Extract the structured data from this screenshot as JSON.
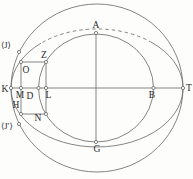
{
  "figure": {
    "style": {
      "background": "#fdfdfc",
      "stroke_color": "#666666",
      "text_color": "#2a2a2a",
      "stroke_width": 0.8,
      "marker_radius": 1.6,
      "marker_fill": "#fdfdfc",
      "font_size": 9.5,
      "small_font_size": 8.5,
      "dash_pattern": "3.5 3"
    },
    "curves": {
      "outer_circle": {
        "cx": 97,
        "cy": 88,
        "rx": 86,
        "ry": 84
      },
      "inner_ellipse": {
        "cx": 96,
        "cy": 88,
        "rx": 57.5,
        "ry": 54
      },
      "middle_ellipse": {
        "cx": 97,
        "cy": 88,
        "rx": 86,
        "ry": 59,
        "solid_arc": "M 41 43.2 A 86 59 0 1 0 152 42.6",
        "dashed_arc": "M 152 42.6 A 86 59 0 0 0 41 43.2"
      }
    },
    "axes": [
      {
        "name": "horizontal-axis",
        "x1": 11,
        "y1": 88,
        "x2": 183,
        "y2": 88
      },
      {
        "name": "vertical-axis",
        "x1": 96,
        "y1": 33,
        "x2": 96,
        "y2": 142
      }
    ],
    "rectangle": {
      "x": 21,
      "y": 62,
      "width": 25,
      "height": 52
    },
    "points": [
      {
        "name": "point-A",
        "x": 96,
        "y": 33
      },
      {
        "name": "point-J",
        "x": 19,
        "y": 52
      },
      {
        "name": "point-O",
        "x": 21,
        "y": 62
      },
      {
        "name": "point-Z",
        "x": 46,
        "y": 62
      },
      {
        "name": "point-K",
        "x": 11,
        "y": 88
      },
      {
        "name": "point-M",
        "x": 21,
        "y": 88
      },
      {
        "name": "point-D",
        "x": 38.5,
        "y": 88
      },
      {
        "name": "point-L",
        "x": 46,
        "y": 88
      },
      {
        "name": "point-B",
        "x": 153.5,
        "y": 88
      },
      {
        "name": "point-T",
        "x": 183,
        "y": 88
      },
      {
        "name": "point-H",
        "x": 21,
        "y": 114
      },
      {
        "name": "point-N",
        "x": 46,
        "y": 114
      },
      {
        "name": "point-J-prime",
        "x": 19,
        "y": 124
      },
      {
        "name": "point-G",
        "x": 96,
        "y": 142
      }
    ],
    "labels": [
      {
        "name": "label-A",
        "text": "A",
        "x": 96,
        "y": 28,
        "anchor": "middle",
        "small": false
      },
      {
        "name": "label-J",
        "text": "⟨J⟩",
        "x": 1,
        "y": 48,
        "anchor": "start",
        "small": true
      },
      {
        "name": "label-Z",
        "text": "Z",
        "x": 44,
        "y": 58,
        "anchor": "middle",
        "small": false
      },
      {
        "name": "label-O",
        "text": "O",
        "x": 26,
        "y": 73,
        "anchor": "middle",
        "small": false
      },
      {
        "name": "label-K",
        "text": "K",
        "x": 5,
        "y": 92,
        "anchor": "middle",
        "small": false
      },
      {
        "name": "label-M",
        "text": "M",
        "x": 20,
        "y": 98,
        "anchor": "middle",
        "small": false
      },
      {
        "name": "label-D",
        "text": "D",
        "x": 30,
        "y": 98.5,
        "anchor": "middle",
        "small": false
      },
      {
        "name": "label-L",
        "text": "L",
        "x": 48.5,
        "y": 98,
        "anchor": "middle",
        "small": false
      },
      {
        "name": "label-B",
        "text": "B",
        "x": 152,
        "y": 98,
        "anchor": "middle",
        "small": false
      },
      {
        "name": "label-T",
        "text": "T",
        "x": 189,
        "y": 91,
        "anchor": "middle",
        "small": false
      },
      {
        "name": "label-H",
        "text": "H",
        "x": 16,
        "y": 108,
        "anchor": "middle",
        "small": false
      },
      {
        "name": "label-N",
        "text": "N",
        "x": 38,
        "y": 121,
        "anchor": "middle",
        "small": false
      },
      {
        "name": "label-J-prime",
        "text": "⟨J′⟩",
        "x": 1,
        "y": 129,
        "anchor": "start",
        "small": true
      },
      {
        "name": "label-G",
        "text": "G",
        "x": 97,
        "y": 152,
        "anchor": "middle",
        "small": false
      }
    ]
  }
}
